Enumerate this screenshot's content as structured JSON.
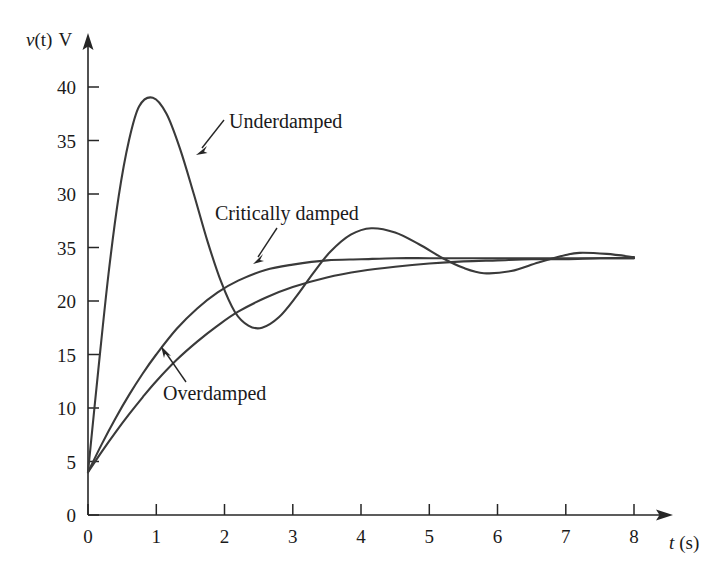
{
  "figure": {
    "background_color": "#ffffff",
    "curve_color": "#3a3a3a",
    "axis_color": "#262626"
  },
  "axes": {
    "y_axis_title": "v(t) V",
    "y_axis_title_variable": "v",
    "y_axis_title_paren": "(t)",
    "y_axis_title_unit": "V",
    "x_axis_title": "t (s)",
    "x_axis_title_variable": "t",
    "x_axis_title_unit": "(s)"
  },
  "chart_data": {
    "type": "line",
    "title": "",
    "subtitle": "",
    "xlabel": "t (s)",
    "ylabel": "v(t) V",
    "xlim": [
      0,
      8.4
    ],
    "ylim": [
      0,
      43
    ],
    "grid": false,
    "legend_position": "inline-annotations",
    "x_ticks": [
      0,
      1,
      2,
      3,
      4,
      5,
      6,
      7,
      8
    ],
    "x_tick_labels": [
      "0",
      "1",
      "2",
      "3",
      "4",
      "5",
      "6",
      "7",
      "8"
    ],
    "y_ticks": [
      0,
      5,
      10,
      15,
      20,
      25,
      30,
      35,
      40
    ],
    "y_tick_labels": [
      "0",
      "5",
      "10",
      "15",
      "20",
      "35",
      "30",
      "35",
      "40"
    ],
    "y_tick_label_note": "Label at the 25 position reads 35 in the source figure",
    "series": [
      {
        "name": "Underdamped",
        "annotation": "Underdamped",
        "steady_state": 24,
        "initial_value": 4,
        "first_peak": {
          "t": 0.95,
          "v": 39.0
        },
        "first_trough": {
          "t": 2.55,
          "v": 17.5
        },
        "second_peak": {
          "t": 4.15,
          "v": 26.8
        },
        "second_trough": {
          "t": 5.8,
          "v": 22.6
        },
        "third_peak": {
          "t": 7.2,
          "v": 24.6
        },
        "x": [
          0,
          0.15,
          0.3,
          0.45,
          0.6,
          0.75,
          0.95,
          1.15,
          1.35,
          1.55,
          1.75,
          1.95,
          2.15,
          2.35,
          2.55,
          2.8,
          3.05,
          3.3,
          3.55,
          3.85,
          4.15,
          4.5,
          4.85,
          5.2,
          5.5,
          5.8,
          6.2,
          6.6,
          7.0,
          7.2,
          7.6,
          8.0
        ],
        "y": [
          4.0,
          13.5,
          22.5,
          29.8,
          35.0,
          38.2,
          39.0,
          37.5,
          34.2,
          30.0,
          25.6,
          21.8,
          19.0,
          17.7,
          17.5,
          18.5,
          20.4,
          22.6,
          24.6,
          26.2,
          26.8,
          26.4,
          25.3,
          24.0,
          23.1,
          22.6,
          22.8,
          23.6,
          24.3,
          24.5,
          24.4,
          24.1
        ]
      },
      {
        "name": "Critically damped",
        "annotation": "Critically damped",
        "steady_state": 24,
        "initial_value": 4,
        "x": [
          0,
          0.2,
          0.4,
          0.6,
          0.8,
          1.0,
          1.3,
          1.6,
          1.9,
          2.2,
          2.6,
          3.0,
          3.5,
          4.0,
          4.5,
          5.0,
          5.5,
          6.0,
          6.5,
          7.0,
          7.5,
          8.0
        ],
        "y": [
          4.0,
          6.6,
          9.0,
          11.2,
          13.2,
          15.0,
          17.4,
          19.3,
          20.8,
          21.9,
          22.9,
          23.4,
          23.8,
          23.9,
          24.0,
          24.0,
          24.0,
          24.0,
          24.0,
          24.0,
          24.0,
          24.0
        ]
      },
      {
        "name": "Overdamped",
        "annotation": "Overdamped",
        "steady_state": 24,
        "initial_value": 4,
        "x": [
          0,
          0.2,
          0.4,
          0.6,
          0.8,
          1.0,
          1.3,
          1.6,
          1.9,
          2.2,
          2.6,
          3.0,
          3.5,
          4.0,
          4.5,
          5.0,
          5.5,
          6.0,
          6.5,
          7.0,
          7.5,
          8.0
        ],
        "y": [
          4.0,
          5.9,
          7.7,
          9.4,
          11.0,
          12.5,
          14.5,
          16.2,
          17.7,
          19.0,
          20.3,
          21.3,
          22.2,
          22.8,
          23.2,
          23.5,
          23.7,
          23.8,
          23.9,
          23.9,
          24.0,
          24.0
        ]
      }
    ]
  },
  "annotations": [
    {
      "id": "underdamped",
      "label": "Underdamped",
      "points_to_curve": "Underdamped"
    },
    {
      "id": "critically-damped",
      "label": "Critically damped",
      "points_to_curve": "Critically damped"
    },
    {
      "id": "overdamped",
      "label": "Overdamped",
      "points_to_curve": "Overdamped"
    }
  ]
}
